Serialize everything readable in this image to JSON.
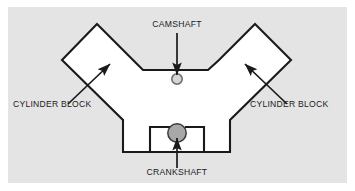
{
  "diagram": {
    "panel": {
      "background_color": "#e4e4e4",
      "x": 8,
      "y": 7,
      "width": 339,
      "height": 176
    },
    "canvas": {
      "background_color": "#ffffff",
      "width": 355,
      "height": 191
    },
    "body": {
      "name": "engine-block-outline",
      "fill_color": "#ffffff",
      "stroke_color": "#1a1a1a",
      "stroke_width": 2.1
    },
    "labels": {
      "camshaft": "CAMSHAFT",
      "crankshaft": "CRANKSHAFT",
      "cylinder_block_left": "CYLINDER BLOCK",
      "cylinder_block_right": "CYLINDER BLOCK"
    },
    "parts": {
      "camshaft": {
        "name": "camshaft",
        "shape": "circle",
        "cx": 177,
        "cy": 79,
        "r": 5.2,
        "fill_color": "#d6d6d6",
        "stroke_color": "#6e6e6e"
      },
      "crankshaft": {
        "name": "crankshaft",
        "shape": "circle",
        "cx": 177,
        "cy": 133,
        "r": 9.2,
        "fill_color": "#a8a8a8",
        "stroke_color": "#3a3a3a"
      }
    },
    "leader_lines": {
      "camshaft_arrow": "vertical-down",
      "crankshaft_arrow": "vertical-up",
      "cylinder_block_left_arrow": "diagonal-up-right",
      "cylinder_block_right_arrow": "diagonal-up-left"
    },
    "text_positions": {
      "camshaft": {
        "x": 177,
        "y": 27
      },
      "crankshaft": {
        "x": 177,
        "y": 175
      },
      "cylinder_block_left": {
        "x": 13,
        "y": 107
      },
      "cylinder_block_right": {
        "x": 250,
        "y": 107
      }
    }
  }
}
